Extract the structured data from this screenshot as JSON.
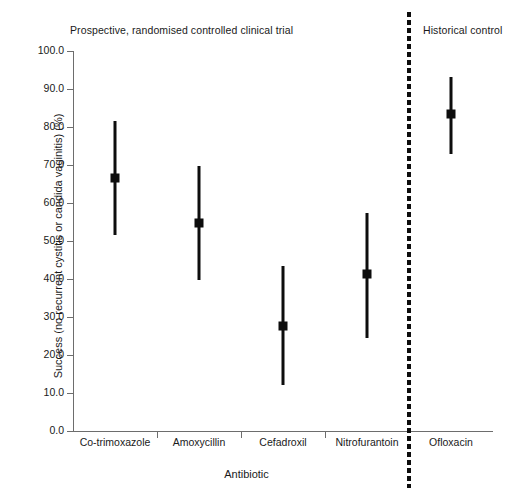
{
  "chart_data": {
    "type": "scatter",
    "title": "",
    "panel_titles": {
      "left": "Prospective, randomised controlled clinical trial",
      "right": "Historical control"
    },
    "xlabel": "Antibiotic",
    "ylabel": "Success (no recurrent cystitis or candida vaginitis) (%)",
    "categories": [
      "Co-trimoxazole",
      "Amoxycillin",
      "Cefadroxil",
      "Nitrofurantoin",
      "Ofloxacin"
    ],
    "values": [
      66.5,
      54.7,
      27.7,
      41.2,
      83.4
    ],
    "error_low": [
      51.5,
      39.8,
      12.0,
      24.6,
      73.0
    ],
    "error_high": [
      81.5,
      69.7,
      43.3,
      57.4,
      93.2
    ],
    "ylim": [
      0.0,
      100.0
    ],
    "ytick_step": 10,
    "ytick_labels": [
      "0.0",
      "10.0",
      "20.0",
      "30.0",
      "40.0",
      "50.0",
      "60.0",
      "70.0",
      "80.0",
      "90.0",
      "100.0"
    ],
    "ytick_values": [
      0,
      10,
      20,
      30,
      40,
      50,
      60,
      70,
      80,
      90,
      100
    ],
    "grid": false,
    "legend": "none",
    "series": [
      {
        "name": "Success rate with 95% CI",
        "points": [
          {
            "category": "Co-trimoxazole",
            "value": 66.5,
            "low": 51.5,
            "high": 81.5,
            "group": "Prospective, randomised controlled clinical trial"
          },
          {
            "category": "Amoxycillin",
            "value": 54.7,
            "low": 39.8,
            "high": 69.7,
            "group": "Prospective, randomised controlled clinical trial"
          },
          {
            "category": "Cefadroxil",
            "value": 27.7,
            "low": 12.0,
            "high": 43.3,
            "group": "Prospective, randomised controlled clinical trial"
          },
          {
            "category": "Nitrofurantoin",
            "value": 41.2,
            "low": 24.6,
            "high": 57.4,
            "group": "Prospective, randomised controlled clinical trial"
          },
          {
            "category": "Ofloxacin",
            "value": 83.4,
            "low": 73.0,
            "high": 93.2,
            "group": "Historical control"
          }
        ]
      }
    ],
    "annotations": [
      {
        "type": "vertical-dashed-divider",
        "after_category": "Nitrofurantoin"
      }
    ]
  },
  "colors": {
    "marker": "#0d0d0d",
    "axis": "#6d6d6d",
    "text": "#1a1a1a",
    "background": "#ffffff"
  }
}
